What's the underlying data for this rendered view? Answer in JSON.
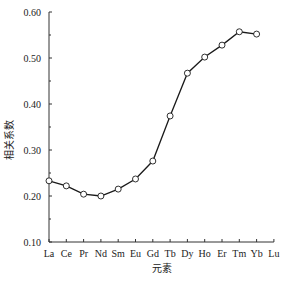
{
  "chart_data": {
    "type": "line",
    "title": "",
    "xlabel": "元素",
    "ylabel": "相关系数",
    "categories": [
      "La",
      "Ce",
      "Pr",
      "Nd",
      "Sm",
      "Eu",
      "Gd",
      "Tb",
      "Dy",
      "Ho",
      "Er",
      "Tm",
      "Yb",
      "Lu"
    ],
    "series": [
      {
        "name": "相关系数",
        "values": [
          0.233,
          0.222,
          0.204,
          0.2,
          0.215,
          0.237,
          0.276,
          0.374,
          0.467,
          0.502,
          0.528,
          0.557,
          0.552,
          null
        ],
        "marker": "open-circle",
        "color": "#1a1a1a"
      }
    ],
    "ylim": [
      0.1,
      0.6
    ],
    "yticks": [
      "0.10",
      "0.20",
      "0.30",
      "0.40",
      "0.50",
      "0.60"
    ],
    "grid": false,
    "legend": "none"
  }
}
